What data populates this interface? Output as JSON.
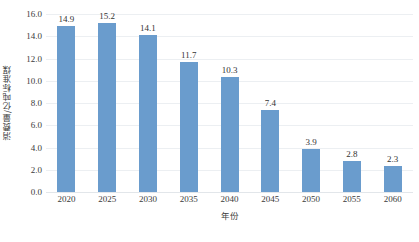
{
  "chart_data": {
    "type": "bar",
    "title": "",
    "subtitle": "",
    "xlabel": "年份",
    "ylabel": "消费量/亿吨标准煤",
    "categories": [
      "2020",
      "2025",
      "2030",
      "2035",
      "2040",
      "2045",
      "2050",
      "2055",
      "2060"
    ],
    "values": [
      14.9,
      15.2,
      14.1,
      11.7,
      10.3,
      7.4,
      3.9,
      2.8,
      2.3
    ],
    "value_labels": [
      "14.9",
      "15.2",
      "14.1",
      "11.7",
      "10.3",
      "7.4",
      "3.9",
      "2.8",
      "2.3"
    ],
    "ylim": [
      0.0,
      16.0
    ],
    "ytick_step": 2.0,
    "ytick_labels": [
      "16.0",
      "14.0",
      "12.0",
      "10.0",
      "8.0",
      "6.0",
      "4.0",
      "2.0",
      "0.0"
    ],
    "ytick_values": [
      16.0,
      14.0,
      12.0,
      10.0,
      8.0,
      6.0,
      4.0,
      2.0,
      0.0
    ],
    "grid": true,
    "grid_axis": "y",
    "legend": false,
    "legend_position": "none",
    "series": [
      {
        "name": "消费量",
        "color": "#6a9ccd",
        "values": [
          14.9,
          15.2,
          14.1,
          11.7,
          10.3,
          7.4,
          3.9,
          2.8,
          2.3
        ]
      }
    ],
    "colors": {
      "bar": "#6a9ccd",
      "gridline": "#eceff2",
      "baseline": "#e2e6ea",
      "text": "#3b3b3b",
      "background": "#ffffff"
    }
  }
}
